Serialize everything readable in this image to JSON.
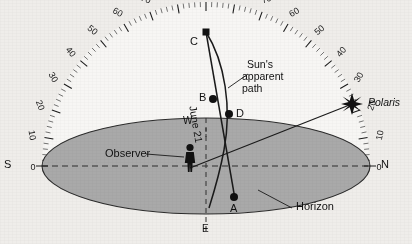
{
  "figure": {
    "type": "celestial-sphere-diagram",
    "background_color": "#efedea",
    "ground_color": "#a9a9a9",
    "ink_color": "#1a1a1a"
  },
  "protractor": {
    "description": "altitude scale arc from horizon to zenith",
    "major_labels": [
      0,
      10,
      20,
      30,
      40,
      50,
      60,
      70,
      80,
      90,
      80,
      70,
      60,
      50,
      40,
      30,
      20,
      10,
      0
    ],
    "left_labels": [
      "0",
      "10",
      "20",
      "30",
      "40",
      "50",
      "60",
      "70",
      "80"
    ],
    "zenith_label": "90",
    "right_labels": [
      "80",
      "70",
      "60",
      "50",
      "40",
      "30",
      "20",
      "10",
      "0"
    ],
    "minor_tick_step_deg": 2,
    "major_tick_step_deg": 10
  },
  "compass": {
    "south": "S",
    "north": "N",
    "west": "W",
    "east": "E"
  },
  "points": {
    "a": "A",
    "b": "B",
    "c": "C",
    "d": "D"
  },
  "labels": {
    "observer": "Observer",
    "horizon": "Horizon",
    "polaris": "Polaris",
    "sun_path_line1": "Sun's",
    "sun_path_line2": "apparent",
    "sun_path_line3": "path",
    "june21": "June 21"
  }
}
